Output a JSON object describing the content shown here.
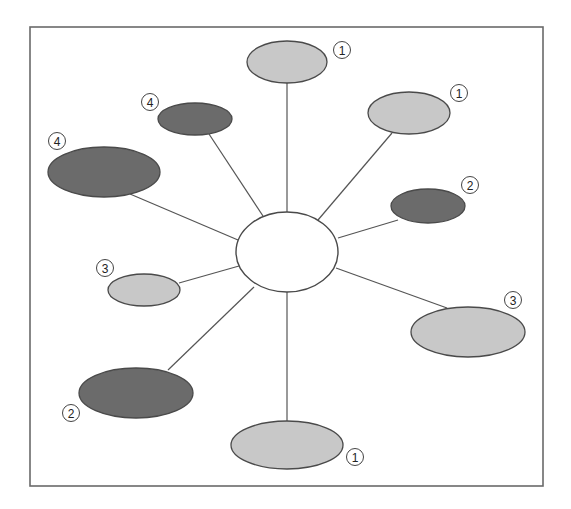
{
  "diagram": {
    "type": "hub-and-spoke",
    "colors": {
      "light": "#c8c8c8",
      "dark": "#6b6b6b",
      "hub": "#ffffff",
      "frame": "#6a6a6a",
      "line": "#555555"
    },
    "hub": {
      "cx": 287,
      "cy": 252,
      "rx": 51,
      "ry": 40,
      "label": ""
    },
    "nodes": [
      {
        "id": "top",
        "shade": "light",
        "cx": 287,
        "cy": 62,
        "rx": 40,
        "ry": 21,
        "badge": "1",
        "bx": 342,
        "by": 50,
        "line": [
          287,
          212,
          287,
          83
        ]
      },
      {
        "id": "upper-right",
        "shade": "light",
        "cx": 409,
        "cy": 113,
        "rx": 41,
        "ry": 21,
        "badge": "1",
        "bx": 459,
        "by": 93,
        "line": [
          318,
          220,
          392,
          133
        ]
      },
      {
        "id": "upper-left",
        "shade": "dark",
        "cx": 195,
        "cy": 119,
        "rx": 37,
        "ry": 16,
        "badge": "4",
        "bx": 150,
        "by": 102,
        "line": [
          263,
          216,
          209,
          134
        ]
      },
      {
        "id": "far-left",
        "shade": "dark",
        "cx": 104,
        "cy": 172,
        "rx": 56,
        "ry": 25,
        "badge": "4",
        "bx": 57,
        "by": 141,
        "line": [
          238,
          240,
          130,
          194
        ]
      },
      {
        "id": "right",
        "shade": "dark",
        "cx": 428,
        "cy": 206,
        "rx": 37,
        "ry": 17,
        "badge": "2",
        "bx": 470,
        "by": 185,
        "line": [
          338,
          238,
          398,
          220
        ]
      },
      {
        "id": "left",
        "shade": "light",
        "cx": 144,
        "cy": 290,
        "rx": 36,
        "ry": 16,
        "badge": "3",
        "bx": 105,
        "by": 268,
        "line": [
          239,
          266,
          179,
          283
        ]
      },
      {
        "id": "lower-right",
        "shade": "light",
        "cx": 468,
        "cy": 332,
        "rx": 57,
        "ry": 25,
        "badge": "3",
        "bx": 513,
        "by": 300,
        "line": [
          336,
          268,
          447,
          308
        ]
      },
      {
        "id": "lower-left",
        "shade": "dark",
        "cx": 136,
        "cy": 393,
        "rx": 57,
        "ry": 25,
        "badge": "2",
        "bx": 71,
        "by": 413,
        "line": [
          254,
          287,
          168,
          370
        ]
      },
      {
        "id": "bottom",
        "shade": "light",
        "cx": 287,
        "cy": 445,
        "rx": 56,
        "ry": 24,
        "badge": "1",
        "bx": 355,
        "by": 457,
        "line": [
          287,
          292,
          287,
          421
        ]
      }
    ]
  },
  "frame": {
    "x": 30,
    "y": 27,
    "width": 513,
    "height": 459
  }
}
